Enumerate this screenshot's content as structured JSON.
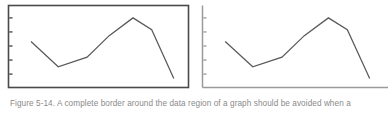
{
  "figure": {
    "caption": "Figure 5-14. A complete border around the data region of a graph should be avoided when a",
    "caption_color": "#8a8a8a",
    "background_color": "#ffffff"
  },
  "chart_data": [
    {
      "id": "left-bordered-graph",
      "type": "line",
      "title": "",
      "xlabel": "",
      "ylabel": "",
      "frame_style": "complete-border",
      "frame_color": "#4a4a4a",
      "line_color": "#5a5a5a",
      "grid": false,
      "legend": false,
      "xlim": [
        0,
        10
      ],
      "ylim": [
        0,
        10
      ],
      "tick_side": "inside",
      "y_ticks": [
        1.2,
        3.1,
        5.0,
        6.9,
        8.8
      ],
      "x": [
        1.0,
        2.6,
        4.3,
        5.6,
        7.0,
        8.1,
        9.4
      ],
      "y": [
        5.6,
        2.2,
        3.5,
        6.4,
        8.8,
        7.2,
        0.6
      ],
      "x_tick_labels": [],
      "y_tick_labels": []
    },
    {
      "id": "right-open-graph",
      "type": "line",
      "title": "",
      "xlabel": "",
      "ylabel": "",
      "frame_style": "left-and-bottom-axes",
      "frame_color": "#9a9a9a",
      "line_color": "#5a5a5a",
      "grid": false,
      "legend": false,
      "xlim": [
        0,
        10
      ],
      "ylim": [
        0,
        10
      ],
      "tick_side": "inside",
      "y_ticks": [
        1.2,
        3.1,
        5.0,
        6.9,
        8.8
      ],
      "x": [
        1.0,
        2.6,
        4.3,
        5.6,
        7.0,
        8.1,
        9.4
      ],
      "y": [
        5.6,
        2.2,
        3.5,
        6.4,
        8.8,
        7.2,
        0.6
      ],
      "x_tick_labels": [],
      "y_tick_labels": []
    }
  ]
}
